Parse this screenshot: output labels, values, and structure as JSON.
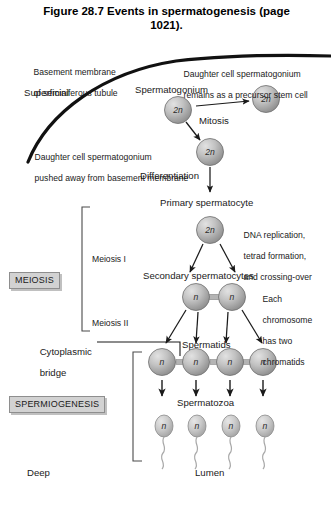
{
  "figure": {
    "title": "Figure 28.7 Events in spermatogenesis (page 1021).",
    "title_line1": "Figure 28.7 Events in spermatogenesis (page",
    "title_line2": "1021)."
  },
  "labels": {
    "basement_membrane_l1": "Basement membrane",
    "basement_membrane_l2": "of seminiferous tubule",
    "superficial": "Superficial",
    "deep": "Deep",
    "lumen": "Lumen",
    "daughter_stem_l1": "Daughter cell spermatogonium",
    "daughter_stem_l2": "remains as a precursor stem cell",
    "spermatogonium": "Spermatogonium",
    "mitosis": "Mitosis",
    "daughter_pushed_l1": "Daughter cell spermatogonium",
    "daughter_pushed_l2": "pushed away from basement membrane",
    "differentiation": "Differentiation",
    "primary_spermatocyte": "Primary spermatocyte",
    "dna_note_l1": "DNA replication,",
    "dna_note_l2": "tetrad formation,",
    "dna_note_l3": "and crossing-over",
    "meiosis_i": "Meiosis I",
    "meiosis_ii": "Meiosis II",
    "secondary_spermatocytes": "Secondary spermatocytes",
    "chromatid_note_l1": "Each",
    "chromatid_note_l2": "chromosome",
    "chromatid_note_l3": "has two",
    "chromatid_note_l4": "chromatids",
    "cytoplasmic_bridge_l1": "Cytoplasmic",
    "cytoplasmic_bridge_l2": "bridge",
    "spermatids": "Spermatids",
    "spermatozoa": "Spermatozoa"
  },
  "section_boxes": {
    "meiosis": "MEIOSIS",
    "spermiogenesis": "SPERMIOGENESIS"
  },
  "cells": {
    "ploidy_diploid": "2n",
    "ploidy_haploid": "n",
    "spermatogonium_parent": "2n",
    "spermatogonium_stem": "2n",
    "spermatogonium_pushed": "2n",
    "primary_spermatocyte": "2n",
    "secondary_left": "n",
    "secondary_right": "n",
    "spermatid_1": "n",
    "spermatid_2": "n",
    "spermatid_3": "n",
    "spermatid_4": "n",
    "spermatozoon_1": "n",
    "spermatozoon_2": "n",
    "spermatozoon_3": "n",
    "spermatozoon_4": "n"
  },
  "colors": {
    "cell_fill_light": "#cfcfcf",
    "cell_fill_dark": "#8f8f8f",
    "cell_stroke": "#6f6f6f",
    "line": "#1a1a1a",
    "membrane": "#111111",
    "box_fill": "#d2d2d2",
    "box_border": "#8e8e8e",
    "background": "#ffffff",
    "text": "#1a1a1a"
  }
}
